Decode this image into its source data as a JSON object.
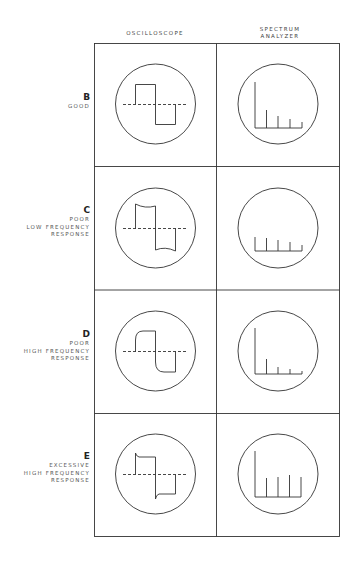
{
  "columns": [
    {
      "label": "OSCILLOSCOPE"
    },
    {
      "label_line1": "SPECTRUM",
      "label_line2": "ANALYZER"
    }
  ],
  "rows": [
    {
      "letter": "B",
      "lines": [
        "GOOD"
      ],
      "scope": "square",
      "spectrum": [
        42,
        18,
        12,
        8
      ]
    },
    {
      "letter": "C",
      "lines": [
        "POOR",
        "LOW FREQUENCY",
        "RESPONSE"
      ],
      "scope": "tilt",
      "spectrum": [
        15,
        12,
        12,
        9
      ]
    },
    {
      "letter": "D",
      "lines": [
        "POOR",
        "HIGH FREQUENCY",
        "RESPONSE"
      ],
      "scope": "rounded",
      "spectrum": [
        45,
        15,
        7,
        5
      ]
    },
    {
      "letter": "E",
      "lines": [
        "EXCESSIVE",
        "HIGH FREQUENCY",
        "RESPONSE"
      ],
      "scope": "overshoot",
      "spectrum": [
        46,
        20,
        21,
        23,
        21
      ]
    }
  ]
}
